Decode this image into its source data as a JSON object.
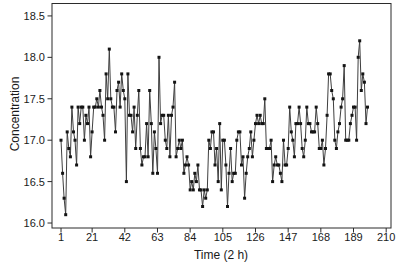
{
  "chart_data": {
    "type": "line",
    "title": "",
    "xlabel": "Time (2 h)",
    "ylabel": "Concentration",
    "series_name": "Chemical process concentration readings",
    "x_start": 1,
    "x_step": 1,
    "xlim": [
      -4.8,
      213.1
    ],
    "ylim": [
      15.94,
      18.65
    ],
    "grid": false,
    "frame": "box",
    "legend_position": "none",
    "marker": "filled-square",
    "colors": {
      "line": "#3f3f3f",
      "marker": "#141414",
      "frame": "#2b2b2b",
      "tick": "#2b2b2b",
      "text": "#1a1a1a",
      "background": "#ffffff"
    },
    "x_ticks": [
      {
        "label": "1",
        "value": 1
      },
      {
        "label": "21",
        "value": 21
      },
      {
        "label": "42",
        "value": 42
      },
      {
        "label": "63",
        "value": 63
      },
      {
        "label": "84",
        "value": 84
      },
      {
        "label": "105",
        "value": 105
      },
      {
        "label": "126",
        "value": 126
      },
      {
        "label": "147",
        "value": 147
      },
      {
        "label": "168",
        "value": 168
      },
      {
        "label": "189",
        "value": 189
      },
      {
        "label": "210",
        "value": 210
      }
    ],
    "y_ticks": [
      {
        "label": "16.0",
        "value": 16.0
      },
      {
        "label": "16.5",
        "value": 16.5
      },
      {
        "label": "17.0",
        "value": 17.0
      },
      {
        "label": "17.5",
        "value": 17.5
      },
      {
        "label": "18.0",
        "value": 18.0
      },
      {
        "label": "18.5",
        "value": 18.5
      }
    ],
    "values": [
      17.0,
      16.6,
      16.3,
      16.1,
      17.1,
      16.9,
      16.8,
      17.4,
      17.1,
      17.0,
      16.7,
      17.4,
      17.2,
      17.4,
      17.4,
      17.0,
      17.3,
      17.2,
      17.4,
      16.8,
      17.1,
      17.4,
      17.4,
      17.5,
      17.4,
      17.6,
      17.4,
      17.3,
      17.0,
      17.8,
      17.5,
      18.1,
      17.5,
      17.4,
      17.4,
      17.1,
      17.6,
      17.7,
      17.4,
      17.8,
      17.6,
      17.5,
      16.5,
      17.8,
      17.3,
      17.3,
      17.1,
      17.4,
      16.9,
      17.3,
      17.6,
      16.9,
      16.7,
      16.8,
      16.8,
      17.2,
      16.8,
      17.6,
      17.2,
      16.6,
      17.1,
      16.9,
      16.6,
      18.0,
      17.2,
      17.3,
      17.3,
      17.0,
      16.9,
      17.3,
      16.8,
      17.3,
      17.4,
      17.7,
      16.8,
      16.9,
      17.0,
      16.9,
      17.0,
      16.6,
      16.7,
      16.8,
      16.7,
      16.4,
      16.5,
      16.4,
      16.6,
      16.5,
      16.7,
      16.4,
      16.4,
      16.2,
      16.4,
      16.3,
      16.4,
      17.0,
      16.9,
      17.1,
      17.1,
      16.7,
      16.9,
      16.5,
      17.2,
      16.4,
      17.0,
      17.0,
      16.7,
      16.2,
      16.6,
      16.9,
      16.5,
      16.6,
      16.6,
      17.0,
      17.1,
      17.1,
      16.7,
      16.8,
      16.3,
      16.6,
      16.8,
      16.9,
      17.1,
      16.8,
      17.0,
      17.2,
      17.3,
      17.2,
      17.3,
      17.2,
      17.2,
      17.5,
      16.9,
      16.9,
      16.9,
      17.0,
      16.5,
      16.7,
      16.8,
      16.7,
      16.7,
      16.6,
      16.5,
      17.0,
      16.7,
      16.7,
      16.9,
      17.4,
      17.1,
      17.0,
      16.8,
      17.2,
      17.2,
      17.4,
      17.2,
      16.9,
      16.8,
      17.0,
      17.4,
      17.2,
      17.2,
      17.1,
      17.1,
      17.1,
      17.4,
      17.2,
      16.9,
      16.9,
      17.0,
      16.7,
      16.9,
      17.3,
      17.8,
      17.8,
      17.6,
      17.5,
      17.0,
      16.9,
      17.1,
      17.2,
      17.4,
      17.5,
      17.9,
      17.0,
      17.0,
      17.0,
      17.2,
      17.3,
      17.4,
      17.4,
      17.0,
      18.0,
      18.2,
      17.6,
      17.8,
      17.7,
      17.2,
      17.4
    ]
  }
}
